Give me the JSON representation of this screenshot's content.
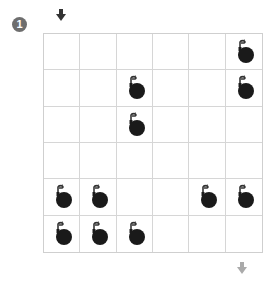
{
  "puzzle": {
    "number": "1",
    "rows": 6,
    "cols": 6,
    "start_arrow": {
      "position": "top",
      "col": 0,
      "color": "#333333"
    },
    "end_arrow": {
      "position": "bottom",
      "col": 5,
      "color": "#aaaaaa"
    },
    "bombs": [
      [
        0,
        5
      ],
      [
        1,
        2
      ],
      [
        1,
        5
      ],
      [
        2,
        2
      ],
      [
        4,
        0
      ],
      [
        4,
        1
      ],
      [
        4,
        4
      ],
      [
        4,
        5
      ],
      [
        5,
        0
      ],
      [
        5,
        1
      ],
      [
        5,
        2
      ]
    ],
    "icon": "bomb-icon",
    "colors": {
      "badge": "#6e6e6e",
      "grid_line": "#d6d6d6",
      "bomb": "#1a1a1a"
    }
  }
}
